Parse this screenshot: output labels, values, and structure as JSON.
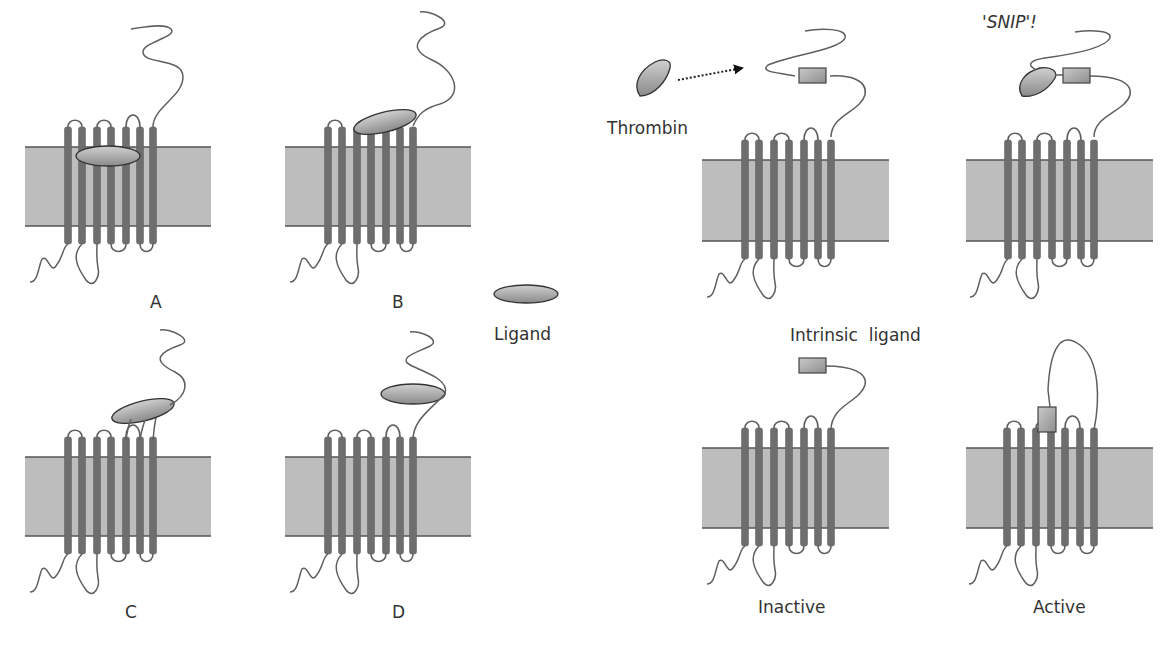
{
  "figure": {
    "panels": [
      {
        "id": "A",
        "label": "A",
        "membrane": {
          "x": 25,
          "y": 147,
          "w": 186,
          "h": 79
        },
        "helix_x": [
          68,
          82,
          97,
          111,
          126,
          140,
          153
        ],
        "ligand_position": "within-membrane"
      },
      {
        "id": "B",
        "label": "B",
        "membrane": {
          "x": 285,
          "y": 147,
          "w": 186,
          "h": 79
        },
        "helix_x": [
          328,
          342,
          357,
          371,
          386,
          400,
          413
        ],
        "ligand_position": "on-extracellular-loops-and-N-terminus"
      },
      {
        "id": "C",
        "label": "C",
        "membrane": {
          "x": 25,
          "y": 457,
          "w": 186,
          "h": 79
        },
        "helix_x": [
          68,
          82,
          97,
          111,
          126,
          140,
          153
        ],
        "ligand_position": "on-extracellular-loops"
      },
      {
        "id": "D",
        "label": "D",
        "membrane": {
          "x": 285,
          "y": 457,
          "w": 186,
          "h": 79
        },
        "helix_x": [
          328,
          342,
          357,
          371,
          386,
          400,
          413
        ],
        "ligand_position": "on-N-terminus"
      },
      {
        "id": "thrombin",
        "label": "Thrombin",
        "membrane": {
          "x": 702,
          "y": 160,
          "w": 187,
          "h": 81
        },
        "helix_x": [
          745,
          759,
          774,
          789,
          804,
          818,
          831
        ]
      },
      {
        "id": "snip",
        "label": "'SNIP'!",
        "membrane": {
          "x": 966,
          "y": 160,
          "w": 187,
          "h": 81
        },
        "helix_x": [
          1008,
          1022,
          1037,
          1052,
          1067,
          1081,
          1094
        ]
      },
      {
        "id": "inactive",
        "label": "Inactive",
        "membrane": {
          "x": 702,
          "y": 448,
          "w": 187,
          "h": 80
        },
        "helix_x": [
          745,
          759,
          774,
          789,
          804,
          818,
          831
        ]
      },
      {
        "id": "active",
        "label": "Active",
        "membrane": {
          "x": 966,
          "y": 448,
          "w": 187,
          "h": 80
        },
        "helix_x": [
          1007,
          1021,
          1036,
          1051,
          1065,
          1080,
          1094
        ]
      }
    ],
    "labels": {
      "A": "A",
      "B": "B",
      "C": "C",
      "D": "D",
      "ligand": "Ligand",
      "thrombin": "Thrombin",
      "snip": "'SNIP'!",
      "intrinsic_ligand": "Intrinsic  ligand",
      "inactive": "Inactive",
      "active": "Active"
    },
    "colors": {
      "membrane": "#bdbdbd",
      "membrane_edge": "#555555",
      "helix": "#6e6e6e",
      "ligand_light": "#c8c8c8",
      "ligand_dark": "#8a8a8a",
      "text": "#333333"
    }
  }
}
